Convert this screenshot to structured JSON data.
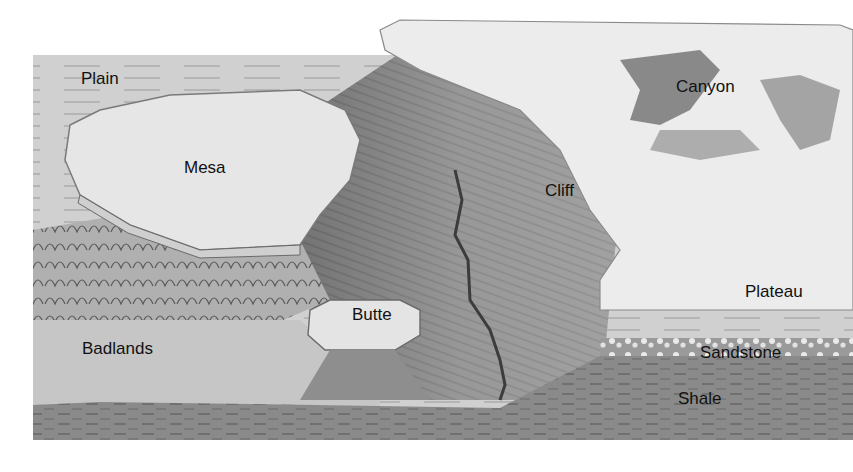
{
  "figure": {
    "type": "labeled-illustration",
    "colors": {
      "background": "#ffffff",
      "plain": "#cfcfcf",
      "plateau_top": "#ededed",
      "slope": "#a9a9a9",
      "canyon_shadow": "#5a5a5a",
      "sandstone": "#bdbdbd",
      "shale": "#8a8a8a",
      "river": "#3c3c3c",
      "label_text": "#111111"
    }
  },
  "labels": {
    "plain": "Plain",
    "mesa": "Mesa",
    "canyon": "Canyon",
    "cliff": "Cliff",
    "plateau": "Plateau",
    "butte": "Butte",
    "badlands": "Badlands",
    "sandstone": "Sandstone",
    "shale": "Shale"
  }
}
